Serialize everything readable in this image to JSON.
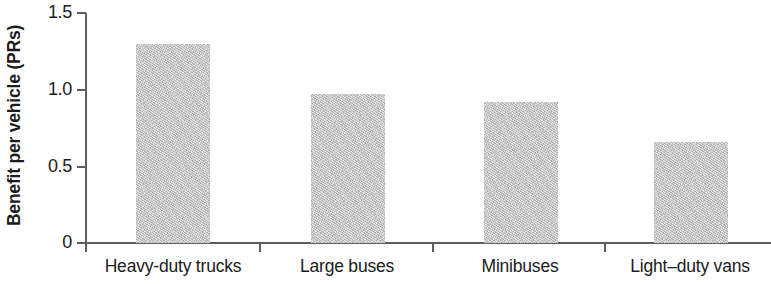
{
  "chart_data": {
    "type": "bar",
    "title": "",
    "xlabel": "",
    "ylabel": "Benefit per vehicle (PRs)",
    "categories": [
      "Heavy-duty trucks",
      "Large buses",
      "Minibuses",
      "Light–duty vans"
    ],
    "values": [
      1.3,
      0.97,
      0.92,
      0.66
    ],
    "ylim": [
      0,
      1.5
    ],
    "yticks": [
      "0",
      "0.5",
      "1.0",
      "1.5"
    ],
    "ytick_values": [
      0,
      0.5,
      1.0,
      1.5
    ],
    "grid": false,
    "legend": null,
    "bar_color": "#c3c3c3",
    "axis_color": "#5d5d5d",
    "text_color": "#1b1b1b"
  },
  "axis": {
    "y_title": "Benefit per vehicle (PRs)"
  }
}
